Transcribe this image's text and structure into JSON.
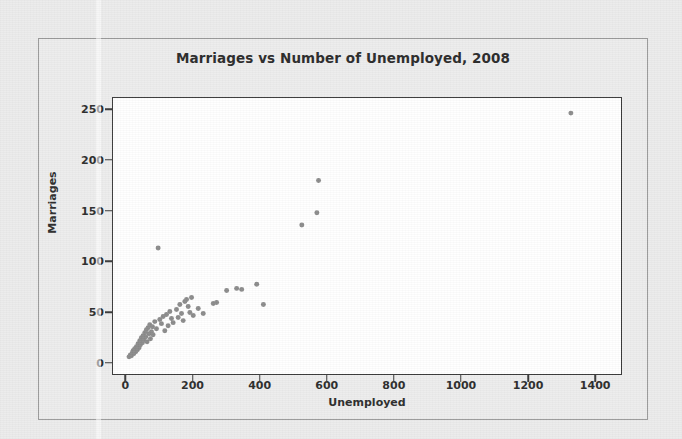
{
  "chart_data": {
    "type": "scatter",
    "title": "Marriages vs Number of Unemployed, 2008",
    "xlabel": "Unemployed",
    "ylabel": "Marriages",
    "xlim": [
      -40,
      1480
    ],
    "ylim": [
      -12,
      262
    ],
    "xticks": [
      0,
      200,
      400,
      600,
      800,
      1000,
      1200,
      1400
    ],
    "yticks": [
      0,
      50,
      100,
      150,
      200,
      250
    ],
    "grid": false,
    "legend": null,
    "marker": {
      "shape": "circle",
      "color": "#8c8c8c",
      "size": 5
    },
    "series": [
      {
        "name": "States",
        "points": [
          [
            8,
            5
          ],
          [
            12,
            7
          ],
          [
            15,
            6
          ],
          [
            18,
            9
          ],
          [
            20,
            11
          ],
          [
            22,
            8
          ],
          [
            25,
            13
          ],
          [
            28,
            10
          ],
          [
            30,
            15
          ],
          [
            33,
            12
          ],
          [
            35,
            18
          ],
          [
            38,
            14
          ],
          [
            40,
            21
          ],
          [
            42,
            17
          ],
          [
            45,
            24
          ],
          [
            48,
            19
          ],
          [
            50,
            26
          ],
          [
            52,
            22
          ],
          [
            55,
            29
          ],
          [
            58,
            25
          ],
          [
            60,
            32
          ],
          [
            62,
            20
          ],
          [
            65,
            34
          ],
          [
            68,
            28
          ],
          [
            70,
            37
          ],
          [
            72,
            23
          ],
          [
            75,
            30
          ],
          [
            78,
            35
          ],
          [
            80,
            27
          ],
          [
            85,
            40
          ],
          [
            90,
            33
          ],
          [
            95,
            113
          ],
          [
            100,
            42
          ],
          [
            105,
            38
          ],
          [
            110,
            45
          ],
          [
            115,
            31
          ],
          [
            120,
            47
          ],
          [
            125,
            36
          ],
          [
            130,
            50
          ],
          [
            135,
            43
          ],
          [
            140,
            39
          ],
          [
            150,
            52
          ],
          [
            155,
            44
          ],
          [
            160,
            57
          ],
          [
            165,
            48
          ],
          [
            170,
            41
          ],
          [
            175,
            60
          ],
          [
            180,
            62
          ],
          [
            185,
            55
          ],
          [
            190,
            49
          ],
          [
            195,
            64
          ],
          [
            200,
            46
          ],
          [
            215,
            53
          ],
          [
            230,
            48
          ],
          [
            260,
            58
          ],
          [
            270,
            59
          ],
          [
            300,
            71
          ],
          [
            330,
            73
          ],
          [
            345,
            72
          ],
          [
            390,
            77
          ],
          [
            410,
            57
          ],
          [
            525,
            136
          ],
          [
            570,
            148
          ],
          [
            575,
            180
          ],
          [
            1330,
            247
          ]
        ]
      }
    ]
  }
}
